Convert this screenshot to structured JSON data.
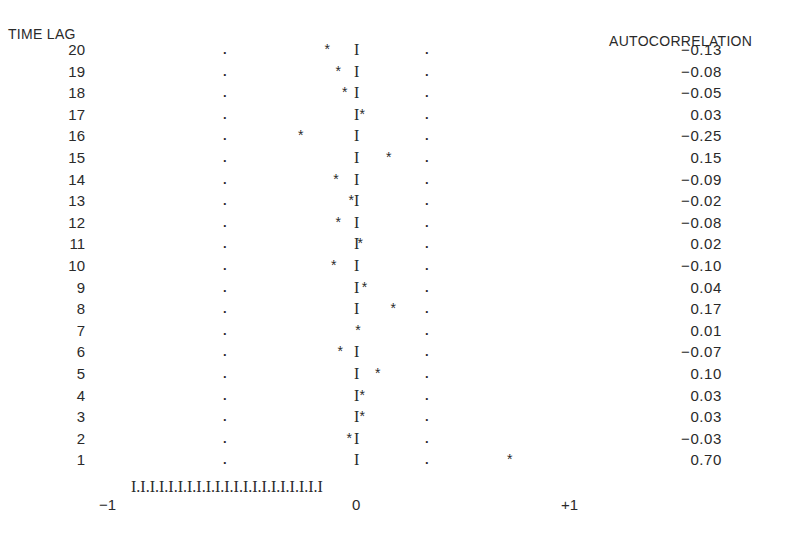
{
  "chart_data": {
    "type": "bar",
    "title": "",
    "xlabel": "",
    "ylabel": "TIME LAG",
    "right_label": "AUTOCORRELATION",
    "categories": [
      20,
      19,
      18,
      17,
      16,
      15,
      14,
      13,
      12,
      11,
      10,
      9,
      8,
      7,
      6,
      5,
      4,
      3,
      2,
      1
    ],
    "values": [
      -0.13,
      -0.08,
      -0.05,
      0.03,
      -0.25,
      0.15,
      -0.09,
      -0.02,
      -0.08,
      0.02,
      -0.1,
      0.04,
      0.17,
      0.01,
      -0.07,
      0.1,
      0.03,
      0.03,
      -0.03,
      0.7
    ],
    "value_labels": [
      "−0.13",
      "−0.08",
      "−0.05",
      "0.03",
      "−0.25",
      "0.15",
      "−0.09",
      "−0.02",
      "−0.08",
      "0.02",
      "−0.10",
      "0.04",
      "0.17",
      "0.01",
      "−0.07",
      "0.10",
      "0.03",
      "0.03",
      "−0.03",
      "0.70"
    ],
    "xlim": [
      -1,
      1
    ],
    "x_tick_labels": [
      "−1",
      "0",
      "+1"
    ],
    "confidence_limits": [
      -0.3,
      0.3
    ],
    "axis_string": "I.I.I.I.I.I.I.I.I.I.I.I.I.I.I.I.I.I.I.I.I",
    "markers": {
      "point": "*",
      "zero_line": "I",
      "limit": "."
    },
    "grid": false
  }
}
